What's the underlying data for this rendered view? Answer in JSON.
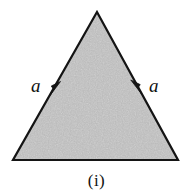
{
  "figure": {
    "caption": "(i)",
    "background_color": "#ffffff",
    "outline_color": "#141414",
    "fill_color": "#b9b9b9",
    "fill_style": "speckled-gray-halftone",
    "outline_width_px": 2,
    "shape": {
      "name": "triangle",
      "type": "equilateral",
      "vertices": {
        "apex": [
          97,
          12
        ],
        "bottom_left": [
          13,
          160
        ],
        "bottom_right": [
          178,
          160
        ]
      }
    },
    "labels": [
      {
        "id": "left-side",
        "text": "a",
        "style": "italic-serif",
        "x": 31,
        "y": 76
      },
      {
        "id": "right-side",
        "text": "a",
        "style": "italic-serif",
        "x": 149,
        "y": 76
      }
    ],
    "arrows": [
      {
        "id": "left-edge-arrow",
        "direction": "up-right",
        "along_edge": "left-side",
        "tip": [
          60,
          82
        ],
        "color": "#141414"
      },
      {
        "id": "right-edge-arrow",
        "direction": "up-left",
        "along_edge": "right-side",
        "tip": [
          131,
          80
        ],
        "color": "#141414"
      }
    ]
  }
}
